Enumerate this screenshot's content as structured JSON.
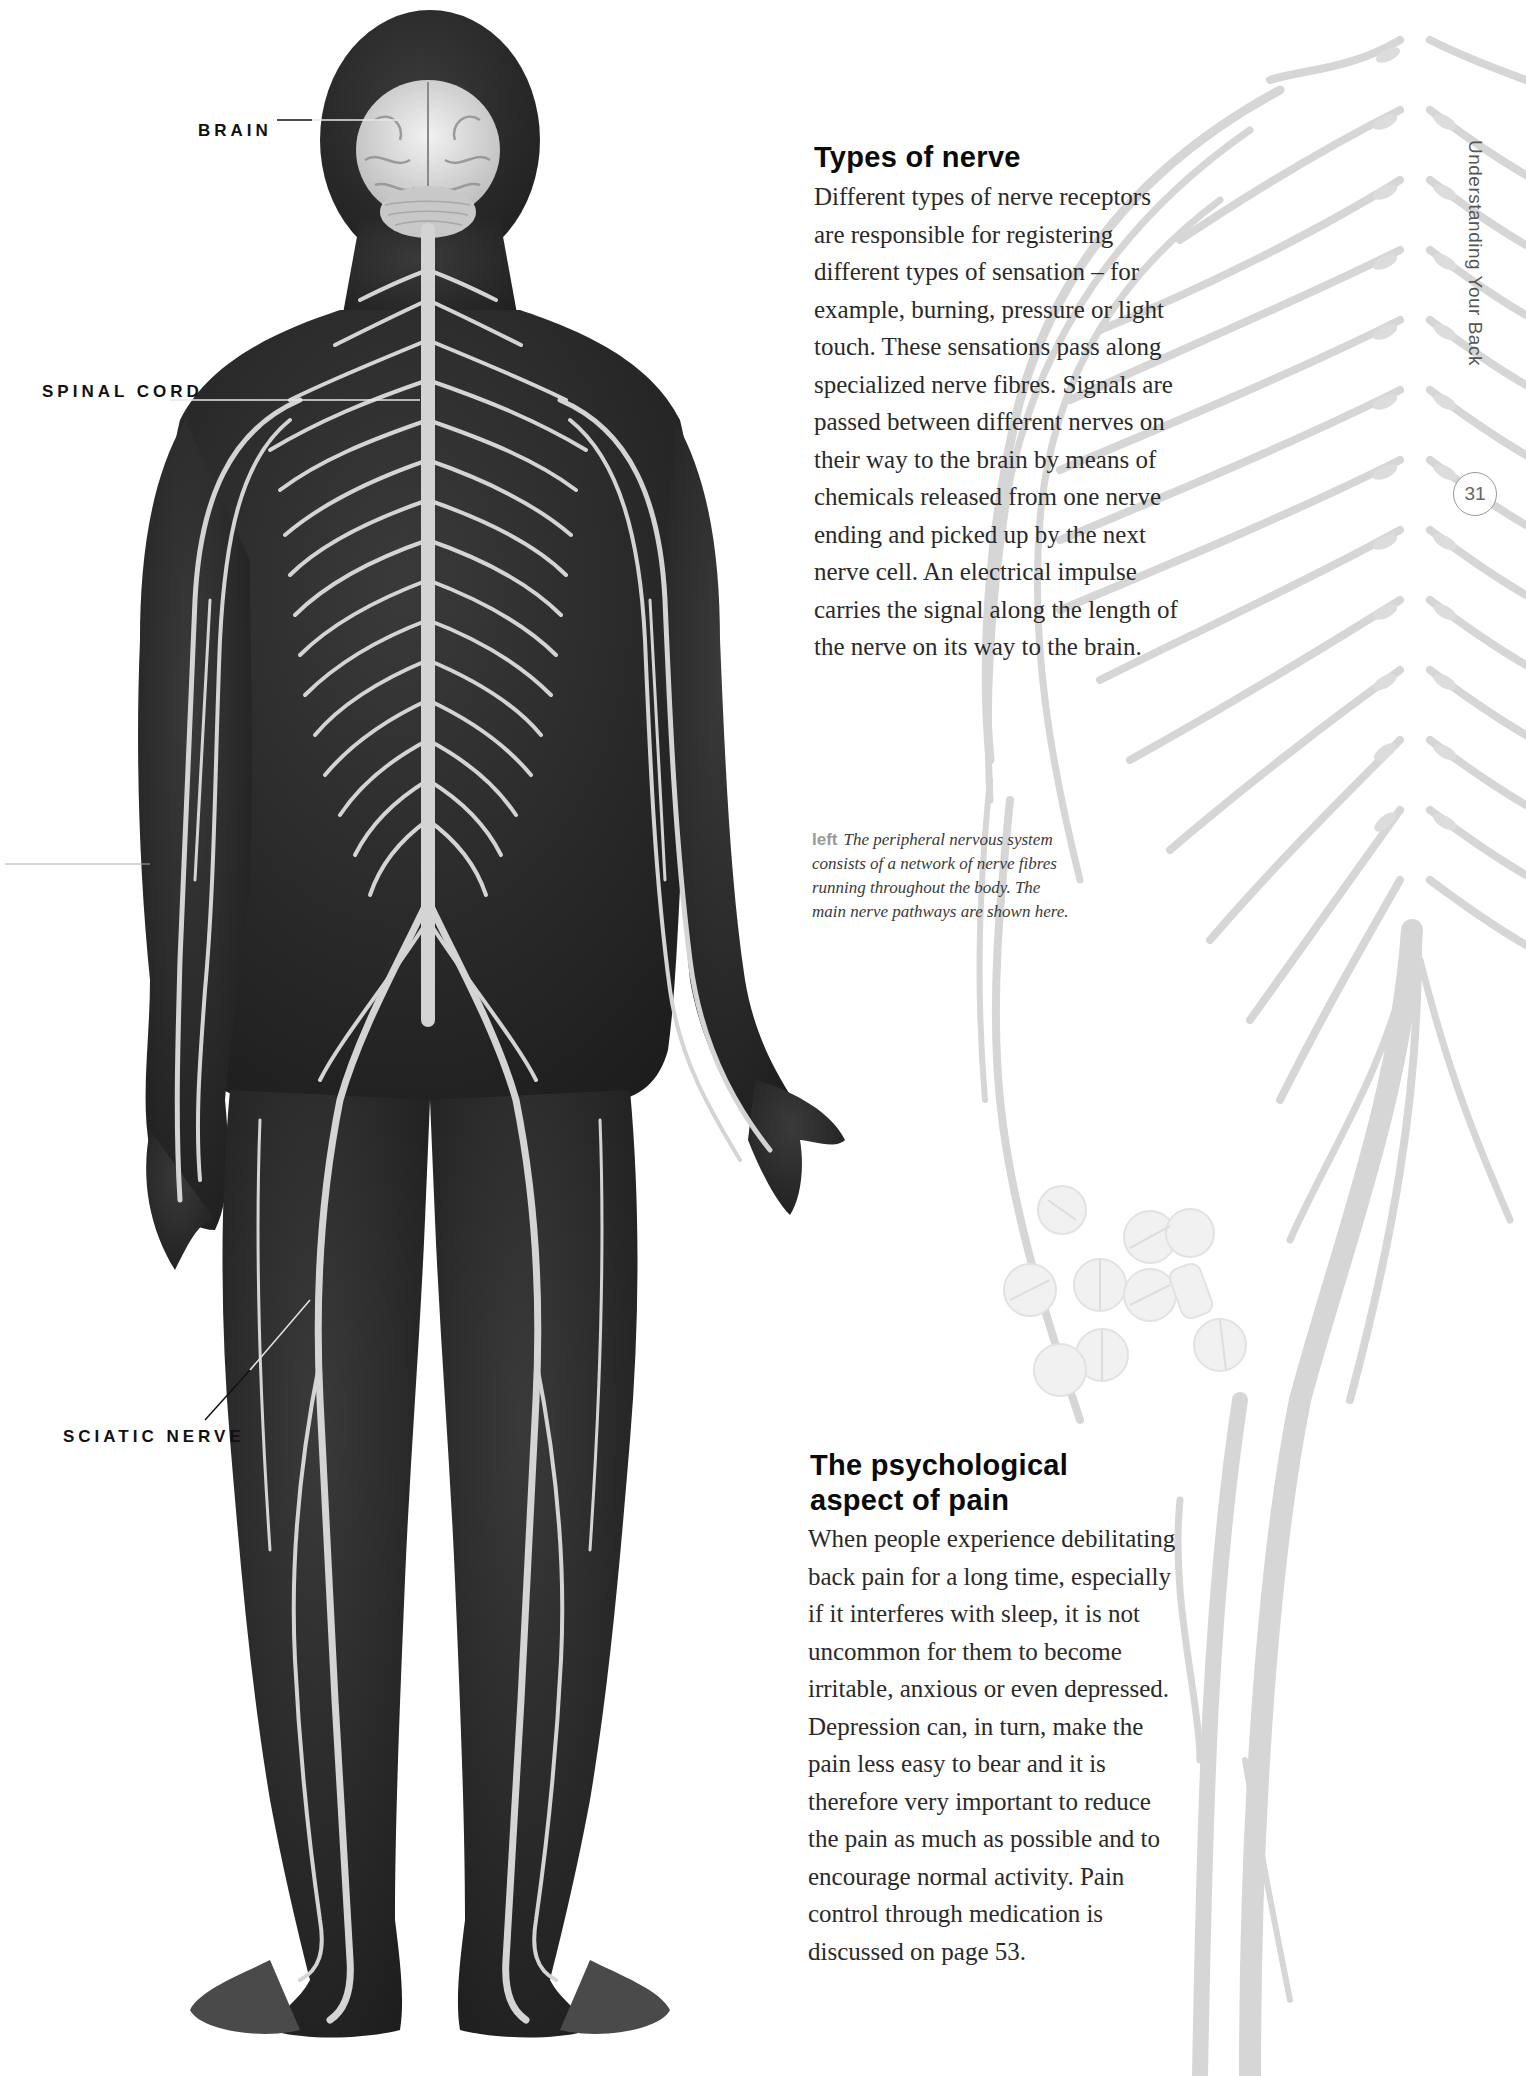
{
  "figure": {
    "labels": {
      "brain": "BRAIN",
      "spinal_cord": "SPINAL CORD",
      "sciatic_nerve": "SCIATIC NERVE"
    },
    "caption": {
      "key": "left",
      "lines": [
        "The peripheral nervous system",
        "consists of a network of nerve fibres",
        "running throughout the body. The",
        "main nerve pathways are shown here."
      ]
    }
  },
  "section1": {
    "heading": "Types of nerve",
    "lines": [
      "Different types of nerve receptors",
      "are responsible for registering",
      "different types of sensation – for",
      "example, burning, pressure or light",
      "touch. These sensations pass along",
      "specialized nerve fibres. Signals are",
      "passed between different nerves on",
      "their way to the brain by means of",
      "chemicals released from one nerve",
      "ending and picked up by the next",
      "nerve cell. An electrical impulse",
      "carries the signal along the length of",
      "the nerve on its way to the brain."
    ]
  },
  "section2": {
    "heading_line1": "The psychological",
    "heading_line2": "aspect of pain",
    "lines": [
      "When people experience debilitating",
      "back pain for a long time, especially",
      "if it interferes with sleep, it is not",
      "uncommon for them to become",
      "irritable, anxious or even depressed.",
      "Depression can, in turn, make the",
      "pain less easy to bear and it is",
      "therefore very important to reduce",
      "the pain as much as possible and to",
      "encourage normal activity. Pain",
      "control through medication is",
      "discussed on page 53."
    ]
  },
  "page": {
    "running_head": "Understanding Your Back",
    "number": "31"
  },
  "colors": {
    "body_silhouette": "#2b2b2b",
    "nerve": "#d8d8d8",
    "background_spine": "#d2d2d2",
    "heading": "#0a0a0a",
    "text": "#2a2a2a",
    "caption_key": "#9a9a9a"
  }
}
